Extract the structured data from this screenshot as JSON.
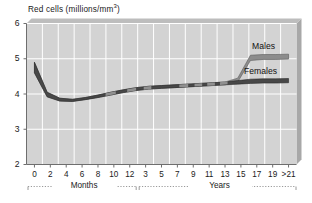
{
  "chart_data": {
    "type": "area",
    "title_main": "Red cells (millions/mm",
    "title_sup": "3",
    "title_tail": ")",
    "xlabel": "",
    "ylabel": "Red cells (millions/mm³)",
    "ylim": [
      2,
      6
    ],
    "yticks": [
      "2",
      "3",
      "4",
      "5",
      "6"
    ],
    "grid": true,
    "legend_position": "inline-right",
    "axis_segments": [
      {
        "name": "Months",
        "bracket_label": "Months",
        "ticks": [
          "0",
          "2",
          "4",
          "6",
          "8",
          "10",
          "12"
        ]
      },
      {
        "name": "Years",
        "bracket_label": "Years",
        "ticks": [
          "3",
          "5",
          "7",
          "9",
          "11",
          "13",
          "15",
          "17",
          "19",
          ">21"
        ]
      }
    ],
    "series": [
      {
        "name": "Males",
        "label": "Males",
        "color": "#8c8c8c",
        "upper": [
          4.9,
          4.05,
          3.88,
          3.85,
          3.9,
          3.97,
          4.05,
          4.12,
          4.18,
          4.22,
          4.24,
          4.26,
          4.28,
          4.3,
          4.32,
          4.34,
          4.45,
          5.1,
          5.12,
          5.12,
          5.13
        ],
        "lower": [
          4.6,
          3.92,
          3.8,
          3.79,
          3.84,
          3.9,
          3.97,
          4.04,
          4.1,
          4.14,
          4.16,
          4.18,
          4.2,
          4.22,
          4.24,
          4.26,
          4.34,
          4.95,
          4.98,
          4.98,
          4.99
        ]
      },
      {
        "name": "Females",
        "label": "Females",
        "color": "#484848",
        "upper": [
          4.9,
          4.05,
          3.88,
          3.85,
          3.9,
          3.97,
          4.05,
          4.12,
          4.18,
          4.22,
          4.24,
          4.26,
          4.28,
          4.3,
          4.32,
          4.34,
          4.38,
          4.42,
          4.43,
          4.43,
          4.44
        ],
        "lower": [
          4.6,
          3.92,
          3.8,
          3.79,
          3.84,
          3.9,
          3.97,
          4.04,
          4.1,
          4.14,
          4.16,
          4.18,
          4.2,
          4.22,
          4.24,
          4.26,
          4.28,
          4.3,
          4.31,
          4.31,
          4.32
        ]
      }
    ],
    "x_positions": [
      0,
      1,
      2,
      3,
      4,
      5,
      6,
      7,
      8,
      9,
      10,
      11,
      12,
      13,
      14,
      15,
      16,
      17,
      18,
      19,
      20
    ],
    "colors": {
      "plot_background": "#d3d3d3",
      "gridline": "#ffffff",
      "axis": "#6e6e6e",
      "shadow": "#a8a8a8",
      "males_band": "#8c8c8c",
      "females_band": "#484848",
      "text": "#1a1a1a"
    }
  }
}
